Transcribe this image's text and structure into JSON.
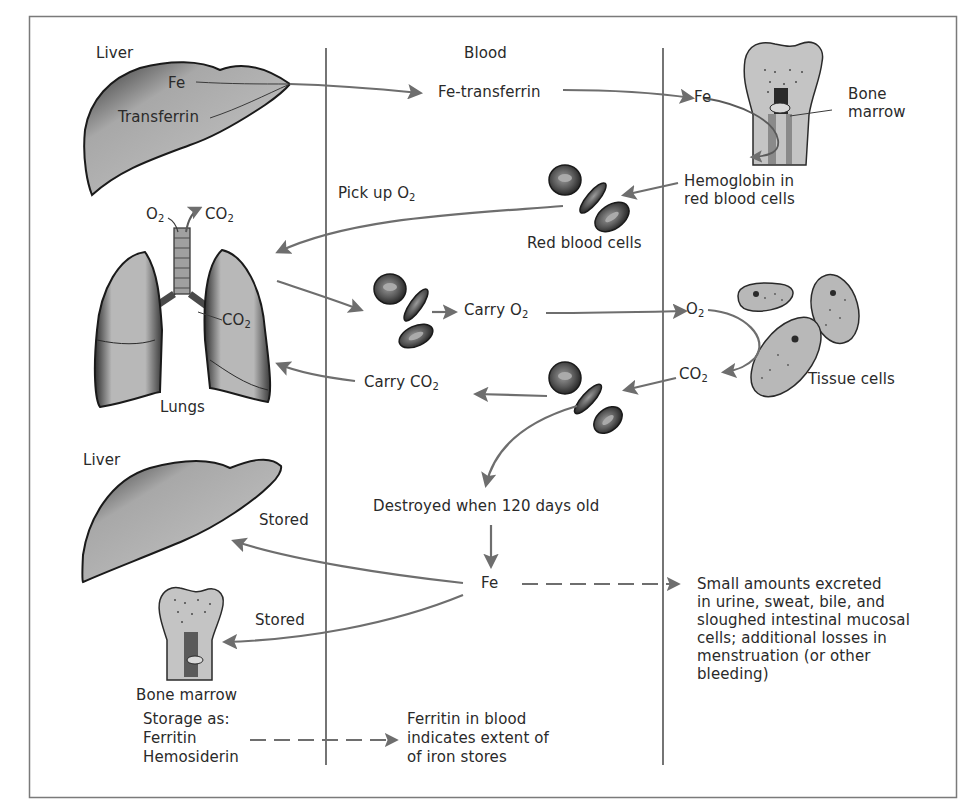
{
  "diagram": {
    "columns": [
      {
        "label": "Liver"
      },
      {
        "label": "Blood"
      }
    ],
    "colors": {
      "frame": "#7a7a7a",
      "divider": "#2a2a2a",
      "arrow": "#6e6e6e",
      "organ_fill": "#c9c9c9",
      "organ_dark": "#3a3a3a",
      "text": "#2a2a2a"
    },
    "labels": {
      "liver_top": "Liver",
      "blood_header": "Blood",
      "fe_liver": "Fe",
      "transferrin": "Transferrin",
      "fe_transferrin": "Fe-transferrin",
      "fe_marrow": "Fe",
      "bone_marrow_top_1": "Bone",
      "bone_marrow_top_2": "marrow",
      "hemoglobin_1": "Hemoglobin in",
      "hemoglobin_2": "red blood cells",
      "red_blood_cells": "Red blood cells",
      "pick_up": "Pick up O",
      "pick_up_sub": "2",
      "lungs_o2": "O",
      "lungs_o2_sub": "2",
      "lungs_co2_top": "CO",
      "lungs_co2_top_sub": "2",
      "lungs_co2_inner": "CO",
      "lungs_co2_inner_sub": "2",
      "lungs": "Lungs",
      "carry_o2": "Carry O",
      "carry_o2_sub": "2",
      "tissue_o2": "O",
      "tissue_o2_sub": "2",
      "tissue_co2": "CO",
      "tissue_co2_sub": "2",
      "tissue_cells": "Tissue cells",
      "carry_co2": "Carry CO",
      "carry_co2_sub": "2",
      "liver_bottom": "Liver",
      "stored_liver": "Stored",
      "destroyed": "Destroyed when 120 days old",
      "fe_center": "Fe",
      "stored_marrow": "Stored",
      "bone_marrow_bottom": "Bone marrow",
      "storage_as": "Storage as:",
      "ferritin": "Ferritin",
      "hemosiderin": "Hemosiderin",
      "ferritin_blood_1": "Ferritin in blood",
      "ferritin_blood_2": "indicates extent of",
      "ferritin_blood_3": "of iron stores",
      "excretion_1": "Small amounts excreted",
      "excretion_2": "in urine, sweat, bile, and",
      "excretion_3": "sloughed intestinal mucosal",
      "excretion_4": "cells; additional losses in",
      "excretion_5": "menstruation (or other",
      "excretion_6": "bleeding)"
    },
    "nodes": [
      "Liver",
      "Fe-transferrin",
      "Bone marrow",
      "Red blood cells",
      "Lungs",
      "Tissue cells",
      "Fe",
      "Liver (storage)",
      "Bone marrow (storage)"
    ],
    "edges": [
      {
        "from": "Liver",
        "to": "Fe-transferrin",
        "style": "solid"
      },
      {
        "from": "Fe-transferrin",
        "to": "Bone marrow",
        "style": "solid"
      },
      {
        "from": "Bone marrow",
        "to": "Hemoglobin in red blood cells",
        "style": "solid"
      },
      {
        "from": "Hemoglobin in red blood cells",
        "to": "Red blood cells",
        "style": "solid"
      },
      {
        "from": "Red blood cells",
        "to": "Lungs",
        "label": "Pick up O2",
        "style": "solid"
      },
      {
        "from": "Lungs",
        "to": "Red blood cells",
        "style": "solid"
      },
      {
        "from": "Red blood cells",
        "to": "Tissue cells",
        "label": "Carry O2",
        "style": "solid"
      },
      {
        "from": "Tissue cells",
        "to": "Red blood cells",
        "label": "CO2",
        "style": "solid"
      },
      {
        "from": "Red blood cells",
        "to": "Lungs",
        "label": "Carry CO2",
        "style": "solid"
      },
      {
        "from": "Red blood cells",
        "to": "Destroyed when 120 days old",
        "style": "solid"
      },
      {
        "from": "Destroyed when 120 days old",
        "to": "Fe",
        "style": "solid"
      },
      {
        "from": "Fe",
        "to": "Liver (storage)",
        "label": "Stored",
        "style": "solid"
      },
      {
        "from": "Fe",
        "to": "Bone marrow (storage)",
        "label": "Stored",
        "style": "solid"
      },
      {
        "from": "Fe",
        "to": "Excretion",
        "style": "dashed"
      },
      {
        "from": "Storage (Ferritin/Hemosiderin)",
        "to": "Ferritin in blood",
        "style": "dashed"
      }
    ]
  }
}
